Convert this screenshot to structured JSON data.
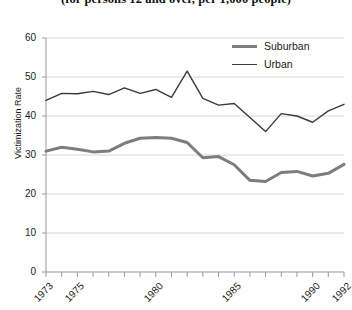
{
  "chart_data": {
    "type": "line",
    "title": "(for persons 12 and over, per 1,000 people)",
    "xlabel": "",
    "ylabel": "Victimization Rate",
    "ylim": [
      0,
      60
    ],
    "xlim": [
      1973,
      1992
    ],
    "yticks": [
      0,
      10,
      20,
      30,
      40,
      50,
      60
    ],
    "ytick_labels": [
      "0",
      "10",
      "20",
      "30",
      "40",
      "50",
      "60"
    ],
    "grid": true,
    "grid_axis": "y",
    "legend_position": "top-right-inside",
    "x": [
      1973,
      1974,
      1975,
      1976,
      1977,
      1978,
      1979,
      1980,
      1981,
      1982,
      1983,
      1984,
      1985,
      1986,
      1987,
      1988,
      1989,
      1990,
      1991,
      1992
    ],
    "xtick_labels": [
      "1973",
      "1975",
      "1980",
      "1985",
      "1990",
      "1992"
    ],
    "xtick_values": [
      1973,
      1975,
      1980,
      1985,
      1990,
      1992
    ],
    "series": [
      {
        "name": "Suburban",
        "color": "#7d7d7d",
        "line_width": 3,
        "values": [
          31.0,
          32.0,
          31.5,
          30.8,
          31.0,
          33.0,
          34.3,
          34.5,
          34.3,
          33.2,
          29.3,
          29.6,
          27.5,
          23.5,
          23.2,
          25.5,
          25.8,
          24.6,
          25.3,
          27.6
        ]
      },
      {
        "name": "Urban",
        "color": "#3a3a3a",
        "line_width": 1.4,
        "values": [
          44.0,
          45.8,
          45.7,
          46.3,
          45.5,
          47.2,
          45.8,
          46.8,
          44.8,
          51.5,
          44.5,
          42.8,
          43.2,
          39.6,
          36.0,
          40.6,
          40.0,
          38.4,
          41.3,
          43.0
        ]
      }
    ]
  },
  "axes": {
    "y_axis_title": "Victimization Rate"
  },
  "legend": {
    "items": [
      {
        "label": "Suburban"
      },
      {
        "label": "Urban"
      }
    ]
  }
}
